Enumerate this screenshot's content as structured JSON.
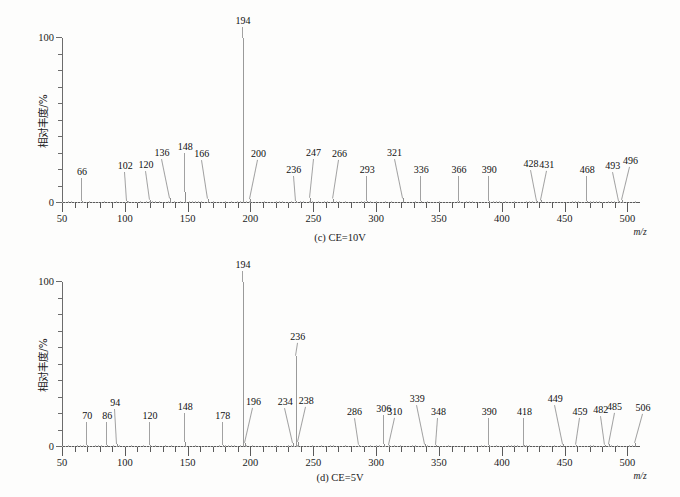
{
  "figure": {
    "y_axis_title": "相对丰度/%",
    "x_axis_title": "m/z",
    "y_ticks": [
      "0",
      "100"
    ],
    "x_ticks": [
      "50",
      "100",
      "150",
      "200",
      "250",
      "300",
      "350",
      "400",
      "450",
      "500"
    ]
  },
  "panels": [
    {
      "id": "c",
      "caption": "(c) CE=10V",
      "chart_data": {
        "type": "bar",
        "title": "(c) CE=10V",
        "xlabel": "m/z",
        "ylabel": "相对丰度/%",
        "xlim": [
          50,
          510
        ],
        "ylim": [
          0,
          100
        ],
        "grid": false,
        "legend": "none",
        "categories": [
          66,
          102,
          120,
          136,
          148,
          166,
          194,
          200,
          236,
          247,
          266,
          293,
          321,
          336,
          366,
          390,
          428,
          431,
          468,
          493,
          496
        ],
        "values": [
          1.5,
          1.5,
          2.0,
          3.0,
          6.5,
          2.5,
          100,
          2.5,
          1.5,
          3.0,
          2.5,
          1.5,
          3.0,
          1.5,
          1.5,
          1.5,
          1.5,
          2.0,
          1.5,
          1.5,
          2.0
        ],
        "labels": [
          "66",
          "102",
          "120",
          "136",
          "148",
          "166",
          "194",
          "200",
          "236",
          "247",
          "266",
          "293",
          "321",
          "336",
          "366",
          "390",
          "428",
          "431",
          "468",
          "493",
          "496"
        ]
      }
    },
    {
      "id": "d",
      "caption": "(d) CE=5V",
      "chart_data": {
        "type": "bar",
        "title": "(d) CE=5V",
        "xlabel": "m/z",
        "ylabel": "相对丰度/%",
        "xlim": [
          50,
          510
        ],
        "ylim": [
          0,
          100
        ],
        "grid": false,
        "legend": "none",
        "categories": [
          70,
          86,
          94,
          120,
          148,
          178,
          194,
          196,
          234,
          236,
          238,
          286,
          306,
          310,
          339,
          348,
          390,
          418,
          449,
          459,
          482,
          485,
          506
        ],
        "values": [
          1.5,
          1.5,
          2.0,
          1.5,
          3.0,
          1.5,
          100,
          2.5,
          2.5,
          55,
          3.0,
          1.5,
          2.0,
          1.5,
          2.0,
          1.5,
          1.5,
          1.5,
          2.0,
          1.5,
          1.5,
          2.0,
          2.5
        ],
        "labels": [
          "70",
          "86",
          "94",
          "120",
          "148",
          "178",
          "194",
          "196",
          "234",
          "236",
          "238",
          "286",
          "306",
          "310",
          "339",
          "348",
          "390",
          "418",
          "449",
          "459",
          "482",
          "485",
          "506"
        ]
      }
    }
  ],
  "annotation_offsets": {
    "c": {
      "66": {
        "dx": 0,
        "dy": 24
      },
      "102": {
        "dx": -2,
        "dy": 30
      },
      "120": {
        "dx": -4,
        "dy": 30
      },
      "136": {
        "dx": -8,
        "dy": 40
      },
      "148": {
        "dx": 0,
        "dy": 40
      },
      "166": {
        "dx": -6,
        "dy": 40
      },
      "194": {
        "dx": 0,
        "dy": 12
      },
      "200": {
        "dx": 8,
        "dy": 40
      },
      "236": {
        "dx": -2,
        "dy": 26
      },
      "247": {
        "dx": 4,
        "dy": 40
      },
      "266": {
        "dx": 6,
        "dy": 40
      },
      "293": {
        "dx": 0,
        "dy": 26
      },
      "321": {
        "dx": -8,
        "dy": 40
      },
      "336": {
        "dx": 0,
        "dy": 26
      },
      "366": {
        "dx": 0,
        "dy": 26
      },
      "390": {
        "dx": 0,
        "dy": 26
      },
      "428": {
        "dx": -6,
        "dy": 32
      },
      "431": {
        "dx": 6,
        "dy": 30
      },
      "468": {
        "dx": 0,
        "dy": 26
      },
      "493": {
        "dx": -6,
        "dy": 30
      },
      "496": {
        "dx": 8,
        "dy": 34
      }
    },
    "d": {
      "70": {
        "dx": 0,
        "dy": 24
      },
      "86": {
        "dx": 0,
        "dy": 24
      },
      "94": {
        "dx": -2,
        "dy": 36
      },
      "120": {
        "dx": 0,
        "dy": 24
      },
      "148": {
        "dx": 0,
        "dy": 30
      },
      "178": {
        "dx": 0,
        "dy": 24
      },
      "194": {
        "dx": 0,
        "dy": 12
      },
      "196": {
        "dx": 8,
        "dy": 36
      },
      "234": {
        "dx": -8,
        "dy": 36
      },
      "236": {
        "dx": 2,
        "dy": 14
      },
      "238": {
        "dx": 8,
        "dy": 36
      },
      "286": {
        "dx": -4,
        "dy": 28
      },
      "306": {
        "dx": 0,
        "dy": 30
      },
      "310": {
        "dx": 6,
        "dy": 28
      },
      "339": {
        "dx": -8,
        "dy": 40
      },
      "348": {
        "dx": 2,
        "dy": 28
      },
      "390": {
        "dx": 0,
        "dy": 28
      },
      "418": {
        "dx": 0,
        "dy": 28
      },
      "449": {
        "dx": -8,
        "dy": 40
      },
      "459": {
        "dx": 4,
        "dy": 28
      },
      "482": {
        "dx": -4,
        "dy": 30
      },
      "485": {
        "dx": 6,
        "dy": 32
      },
      "506": {
        "dx": 8,
        "dy": 30
      }
    }
  }
}
